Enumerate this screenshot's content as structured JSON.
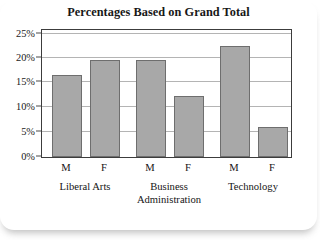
{
  "chart_data": {
    "type": "bar",
    "title": "Percentages Based on Grand Total",
    "xlabel": "",
    "ylabel": "",
    "ylim": [
      0,
      26
    ],
    "grid": true,
    "legend": "none",
    "yticks": [
      {
        "label": "0%",
        "value": 0
      },
      {
        "label": "5%",
        "value": 5
      },
      {
        "label": "10%",
        "value": 10
      },
      {
        "label": "15%",
        "value": 15
      },
      {
        "label": "20%",
        "value": 20
      },
      {
        "label": "25%",
        "value": 25
      }
    ],
    "groups": [
      {
        "label": "Liberal Arts",
        "label_lines": [
          "Liberal Arts"
        ],
        "bars": [
          {
            "series": "M",
            "value": 16.7
          },
          {
            "series": "F",
            "value": 19.9
          }
        ]
      },
      {
        "label": "Business Administration",
        "label_lines": [
          "Business",
          "Administration"
        ],
        "bars": [
          {
            "series": "M",
            "value": 19.9
          },
          {
            "series": "F",
            "value": 12.5
          }
        ]
      },
      {
        "label": "Technology",
        "label_lines": [
          "Technology"
        ],
        "bars": [
          {
            "series": "M",
            "value": 22.8
          },
          {
            "series": "F",
            "value": 6.2
          }
        ]
      }
    ],
    "categories": [
      "Liberal Arts M",
      "Liberal Arts F",
      "Business Administration M",
      "Business Administration F",
      "Technology M",
      "Technology F"
    ],
    "values": [
      16.7,
      19.9,
      19.9,
      12.5,
      22.8,
      6.2
    ],
    "colors": {
      "bar_fill": "#a8a8a8",
      "bar_border": "#6e6e6e",
      "gridline": "#b4b4b4",
      "frame": "#3c3c3c",
      "text": "#141414",
      "background": "#ffffff"
    }
  },
  "yticks": {
    "t0": "0%",
    "t1": "5%",
    "t2": "10%",
    "t3": "15%",
    "t4": "20%",
    "t5": "25%"
  },
  "series_labels": {
    "g0b0": "M",
    "g0b1": "F",
    "g1b0": "M",
    "g1b1": "F",
    "g2b0": "M",
    "g2b1": "F"
  },
  "group_labels": {
    "g0_l0": "Liberal Arts",
    "g1_l0": "Business",
    "g1_l1": "Administration",
    "g2_l0": "Technology"
  },
  "title": "Percentages Based on Grand Total"
}
